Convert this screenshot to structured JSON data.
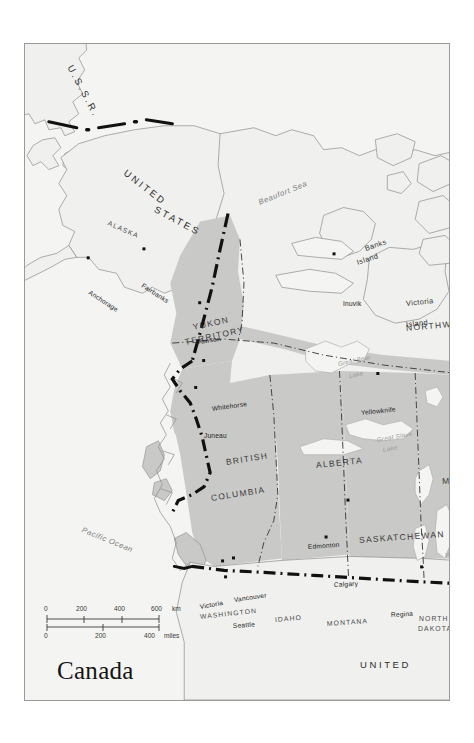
{
  "map": {
    "title": "Canada",
    "north_label": "N",
    "scale": {
      "km_unit": "km",
      "miles_unit": "miles",
      "km_ticks": [
        "0",
        "200",
        "400",
        "600"
      ],
      "miles_ticks": [
        "0",
        "200",
        "400"
      ]
    },
    "colors": {
      "land_fill": "#f7f7f5",
      "canada_fill": "#c9c9c7",
      "paper": "#f4f4f2",
      "coastline": "#8c8c8a",
      "border_dash": "#111111",
      "lake_outline": "#b0b0ae",
      "frame": "#9a9a98"
    },
    "countries": [
      {
        "name": "U.S.S.R.",
        "x": 45,
        "y": 17,
        "rot": 62
      },
      {
        "name": "UNITED",
        "x": 100,
        "y": 123,
        "rot": 38
      },
      {
        "name": "STATES",
        "x": 130,
        "y": 160,
        "rot": 28
      },
      {
        "name": "UNITED",
        "x": 335,
        "y": 616,
        "rot": 0
      }
    ],
    "provinces": [
      {
        "name": "YUKON",
        "x": 168,
        "y": 279,
        "rot": -12
      },
      {
        "name": "TERRITORY",
        "x": 160,
        "y": 294,
        "rot": -12
      },
      {
        "name": "NORTHWEST",
        "x": 381,
        "y": 280,
        "rot": -5
      },
      {
        "name": "BRITISH",
        "x": 201,
        "y": 414,
        "rot": -9
      },
      {
        "name": "COLUMBIA",
        "x": 186,
        "y": 450,
        "rot": -9
      },
      {
        "name": "ALBERTA",
        "x": 291,
        "y": 417,
        "rot": -6
      },
      {
        "name": "SASKATCHEWAN",
        "x": 334,
        "y": 492,
        "rot": -4
      },
      {
        "name": "MANI",
        "x": 417,
        "y": 433,
        "rot": -3
      }
    ],
    "states": [
      {
        "name": "ALASKA",
        "x": 83,
        "y": 176,
        "rot": 24
      },
      {
        "name": "WASHINGTON",
        "x": 175,
        "y": 570,
        "rot": -6
      },
      {
        "name": "IDAHO",
        "x": 250,
        "y": 573,
        "rot": -5
      },
      {
        "name": "MONTANA",
        "x": 302,
        "y": 577,
        "rot": -4
      },
      {
        "name": "NORTH",
        "x": 394,
        "y": 572,
        "rot": 0
      },
      {
        "name": "DAKOTA",
        "x": 393,
        "y": 582,
        "rot": 0
      }
    ],
    "cities": [
      {
        "name": "Anchorage",
        "x": 64,
        "y": 262,
        "lx": 64,
        "ly": 245,
        "rot": 33
      },
      {
        "name": "Fairbanks",
        "x": 120,
        "y": 253,
        "lx": 117,
        "ly": 238,
        "rot": 33
      },
      {
        "name": "Inuvik",
        "x": 311,
        "y": 258,
        "lx": 318,
        "ly": 257,
        "rot": 0
      },
      {
        "name": "Dawson",
        "x": 176,
        "y": 307,
        "lx": 171,
        "ly": 295,
        "rot": -7
      },
      {
        "name": "Whitehorse",
        "x": 180,
        "y": 365,
        "lx": 187,
        "ly": 362,
        "rot": -8
      },
      {
        "name": "Juneau",
        "x": 172,
        "y": 392,
        "lx": 179,
        "ly": 389,
        "rot": 0
      },
      {
        "name": "Yellowknife",
        "x": 355,
        "y": 378,
        "lx": 336,
        "ly": 366,
        "rot": -6
      },
      {
        "name": "Edmonton",
        "x": 325,
        "y": 505,
        "lx": 283,
        "ly": 500,
        "rot": -4
      },
      {
        "name": "Calgary",
        "x": 303,
        "y": 542,
        "lx": 309,
        "ly": 538,
        "rot": -3
      },
      {
        "name": "Regina",
        "x": 399,
        "y": 572,
        "lx": 366,
        "ly": 568,
        "rot": -3
      },
      {
        "name": "Vancouver",
        "x": 210,
        "y": 563,
        "lx": 209,
        "ly": 553,
        "rot": -8
      },
      {
        "name": "Victoria",
        "x": 199,
        "y": 566,
        "lx": 175,
        "ly": 560,
        "rot": -10
      },
      {
        "name": "Seattle",
        "x": 202,
        "y": 582,
        "lx": 208,
        "ly": 579,
        "rot": -4
      }
    ],
    "water": [
      {
        "name": "Beaufort Sea",
        "x": 234,
        "y": 155,
        "rot": -22,
        "size": "lg"
      },
      {
        "name": "Pacific Ocean",
        "x": 57,
        "y": 482,
        "rot": 22,
        "size": "lg"
      },
      {
        "name": "Great Bear",
        "x": 313,
        "y": 317,
        "rot": -12,
        "size": "sm"
      },
      {
        "name": "Lake",
        "x": 324,
        "y": 329,
        "rot": -12,
        "size": "sm"
      },
      {
        "name": "Great Slave",
        "x": 352,
        "y": 393,
        "rot": -10,
        "size": "sm"
      },
      {
        "name": "Lake",
        "x": 358,
        "y": 403,
        "rot": -10,
        "size": "sm"
      },
      {
        "name": "Lake",
        "x": 424,
        "y": 498,
        "rot": -5,
        "size": "sm"
      },
      {
        "name": "Winnipeg",
        "x": 420,
        "y": 508,
        "rot": -5,
        "size": "sm"
      }
    ],
    "islands": [
      {
        "name": "Banks",
        "x": 340,
        "y": 201,
        "rot": -18
      },
      {
        "name": "Island",
        "x": 332,
        "y": 215,
        "rot": -18
      },
      {
        "name": "Victoria",
        "x": 381,
        "y": 256,
        "rot": -6
      },
      {
        "name": "Island",
        "x": 381,
        "y": 277,
        "rot": -6
      }
    ]
  }
}
